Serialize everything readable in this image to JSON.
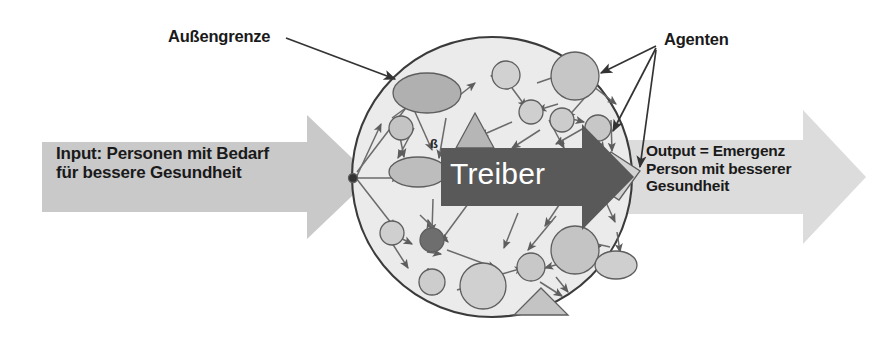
{
  "diagram": {
    "language": "de",
    "background_color": "#ffffff"
  },
  "labels": {
    "boundary": "Außengrenze",
    "agents": "Agenten",
    "input": "Input: Personen mit Bedarf\nfür bessere Gesundheit",
    "output": "Output = Emergenz\nPerson mit besserer\nGesundheit",
    "driver": "Treiber"
  },
  "colors": {
    "band_gray": "#c9c9c9",
    "driver_arrow": "#595959",
    "driver_text": "#ffffff",
    "circle_fill": "#ebebeb",
    "circle_stroke": "#3b3b3b",
    "node_light": "#d4d4d4",
    "node_mid": "#b0b0b0",
    "node_dark": "#6e6e6e",
    "edge": "#6b6b6b",
    "text": "#1a1a1a"
  },
  "system": {
    "boundary_shape": "circle",
    "boundary_center": [
      492,
      177
    ],
    "boundary_radius": 140,
    "node_count": 20,
    "agent_shapes": [
      "circle",
      "ellipse",
      "triangle",
      "diamond"
    ]
  },
  "flow": {
    "input_arrow": "left-to-right",
    "output_arrow": "left-to-right",
    "driver_arrow": "left-to-right"
  }
}
